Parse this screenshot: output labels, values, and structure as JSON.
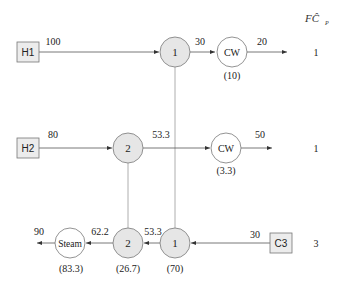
{
  "header": {
    "column_label": "FĈ",
    "column_subscript": "P"
  },
  "streams": [
    {
      "id": "H1",
      "fcp": "1",
      "inlet_temp": "100",
      "after_exchanger_temp": "30",
      "outlet_temp": "20"
    },
    {
      "id": "H2",
      "fcp": "1",
      "inlet_temp": "80",
      "after_exchanger_temp": "53.3",
      "outlet_temp": "50"
    },
    {
      "id": "C3",
      "fcp": "3",
      "inlet_temp": "30",
      "mid_temp": "53.3",
      "after_exchanger_temp": "62.2",
      "outlet_temp": "90"
    }
  ],
  "exchangers": [
    {
      "id": "1",
      "label": "1",
      "duty": "(70)"
    },
    {
      "id": "2",
      "label": "2",
      "duty": "(26.7)"
    }
  ],
  "utilities": [
    {
      "label": "CW",
      "stream": "H1",
      "duty": "(10)"
    },
    {
      "label": "CW",
      "stream": "H2",
      "duty": "(3.3)"
    },
    {
      "label": "Steam",
      "stream": "C3",
      "duty": "(83.3)"
    }
  ],
  "colors": {
    "line": "#555555",
    "exchanger_fill": "#e6e6e6",
    "box_fill": "#ececec",
    "text": "#222222"
  }
}
